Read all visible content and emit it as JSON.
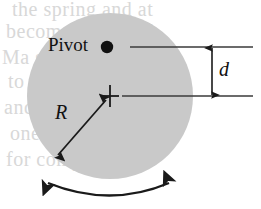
{
  "figure": {
    "labels": {
      "pivot": "Pivot",
      "distance": "d",
      "radius": "R"
    },
    "geometry": {
      "disk_center_x": 110,
      "disk_center_y": 96,
      "disk_radius": 83,
      "pivot_x": 107,
      "pivot_y": 47,
      "center_mark_x": 110,
      "center_mark_y": 96,
      "pivot_line_y": 47,
      "center_line_y": 96,
      "lines_right_x": 253,
      "dimension_arrow_x": 212,
      "radius_arrow_end_x": 55,
      "radius_arrow_end_y": 158,
      "swing_arc_left_x": 45,
      "swing_arc_right_x": 172,
      "swing_arc_y": 181
    },
    "colors": {
      "disk_fill": "#c9c9c9",
      "ink": "#1a1a1a",
      "leader_line": "#3a3a3a",
      "background": "#ffffff",
      "ghost_text": "#d8d8d8"
    },
    "icons": {
      "pivot_point": "filled-dot",
      "center_mark": "cross-mark",
      "dimension": "double-headed-vertical-arrow",
      "radius": "double-headed-diagonal-arrow",
      "swing": "double-headed-curved-arrow"
    }
  },
  "background_text": {
    "lines": [
      "the spring and at",
      "becomes  of which",
      "Ma  sum  for  abbre",
      "to  a  specific  and",
      "and  then  the  first",
      "one  is  the  second",
      "for  compare  must"
    ]
  }
}
